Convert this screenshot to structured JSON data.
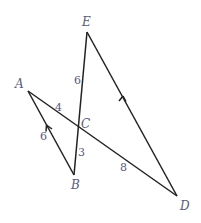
{
  "points": {
    "A": {
      "label": "A",
      "x": 28,
      "y": 91,
      "lx": 15,
      "ly": 87
    },
    "B": {
      "label": "B",
      "x": 74,
      "y": 175,
      "lx": 71,
      "ly": 188
    },
    "C": {
      "label": "C",
      "x": 78,
      "y": 127,
      "lx": 82,
      "ly": 127
    },
    "D": {
      "label": "D",
      "x": 177,
      "y": 196,
      "lx": 180,
      "ly": 209
    },
    "E": {
      "label": "E",
      "x": 87,
      "y": 32,
      "lx": 80,
      "ly": 26
    }
  },
  "segments": [
    {
      "from": "A",
      "to": "D"
    },
    {
      "from": "E",
      "to": "B"
    },
    {
      "from": "A",
      "to": "B"
    },
    {
      "from": "E",
      "to": "D"
    }
  ],
  "measures": {
    "EC": "6",
    "AC": "4",
    "AB": "6",
    "CB": "3",
    "CD": "8"
  },
  "parallel_marks": [
    "AB",
    "ED"
  ]
}
